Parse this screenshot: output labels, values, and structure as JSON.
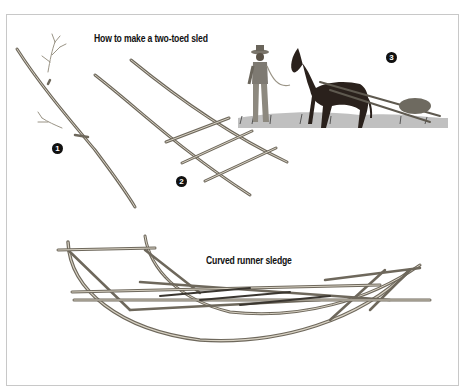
{
  "figure": {
    "title_top": "How to make a two-toed sled",
    "title_bottom": "Curved runner sledge",
    "steps": [
      {
        "number": "1",
        "description": "forked branch with two toes"
      },
      {
        "number": "2",
        "description": "poles lashed with crosspieces"
      },
      {
        "number": "3",
        "description": "horse pulling sled, man leading"
      }
    ]
  },
  "colors": {
    "ink": "#111111",
    "wood": "#8a8478",
    "wood_light": "#c9c3b6",
    "horse": "#2a211c",
    "grass": "#6b6b6b",
    "frame": "#c8c8c8"
  }
}
